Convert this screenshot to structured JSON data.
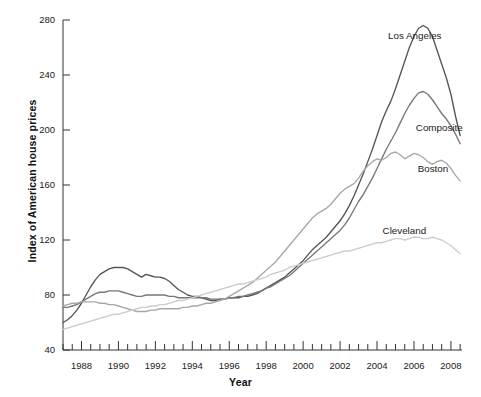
{
  "chart_data": {
    "type": "line",
    "title": "",
    "xlabel": "Year",
    "ylabel": "Index of American house prices",
    "xlim": [
      1987.0,
      2008.6
    ],
    "ylim": [
      40,
      280
    ],
    "yticks": [
      40,
      80,
      120,
      160,
      200,
      240,
      280
    ],
    "xticks": [
      1988,
      1990,
      1992,
      1994,
      1996,
      1998,
      2000,
      2002,
      2004,
      2006,
      2008
    ],
    "xtick_labels": [
      "1988",
      "1990",
      "1992",
      "1994",
      "1996",
      "1998",
      "2000",
      "2002",
      "2004",
      "2006",
      "2008"
    ],
    "ytick_labels": [
      "40",
      "80",
      "120",
      "160",
      "200",
      "240",
      "280"
    ],
    "minor_tick_interval": 0.5,
    "grid": false,
    "legend": "inline-annotations",
    "series": [
      {
        "name": "Los Angeles",
        "color": "#555555",
        "label_x": 2004.6,
        "label_y": 268,
        "x": [
          1987.0,
          1987.25,
          1987.5,
          1987.75,
          1988.0,
          1988.25,
          1988.5,
          1988.75,
          1989.0,
          1989.25,
          1989.5,
          1989.75,
          1990.0,
          1990.25,
          1990.5,
          1990.75,
          1991.0,
          1991.25,
          1991.5,
          1991.75,
          1992.0,
          1992.25,
          1992.5,
          1992.75,
          1993.0,
          1993.25,
          1993.5,
          1993.75,
          1994.0,
          1994.25,
          1994.5,
          1994.75,
          1995.0,
          1995.25,
          1995.5,
          1995.75,
          1996.0,
          1996.25,
          1996.5,
          1996.75,
          1997.0,
          1997.25,
          1997.5,
          1997.75,
          1998.0,
          1998.25,
          1998.5,
          1998.75,
          1999.0,
          1999.25,
          1999.5,
          1999.75,
          2000.0,
          2000.25,
          2000.5,
          2000.75,
          2001.0,
          2001.25,
          2001.5,
          2001.75,
          2002.0,
          2002.25,
          2002.5,
          2002.75,
          2003.0,
          2003.25,
          2003.5,
          2003.75,
          2004.0,
          2004.25,
          2004.5,
          2004.75,
          2005.0,
          2005.25,
          2005.5,
          2005.75,
          2006.0,
          2006.25,
          2006.5,
          2006.75,
          2007.0,
          2007.25,
          2007.5,
          2007.75,
          2008.0,
          2008.25,
          2008.5
        ],
        "y": [
          60,
          62,
          65,
          69,
          74,
          80,
          86,
          91,
          95,
          97,
          99,
          100,
          100,
          100,
          99,
          97,
          95,
          93,
          95,
          94,
          93,
          93,
          92,
          90,
          87,
          84,
          82,
          80,
          79,
          79,
          78,
          77,
          76,
          76,
          77,
          77,
          78,
          78,
          78,
          79,
          79,
          80,
          81,
          83,
          85,
          87,
          89,
          91,
          93,
          96,
          99,
          102,
          105,
          109,
          113,
          116,
          119,
          122,
          126,
          130,
          134,
          139,
          145,
          152,
          160,
          168,
          177,
          186,
          196,
          206,
          214,
          221,
          230,
          240,
          250,
          260,
          268,
          274,
          276,
          274,
          268,
          258,
          248,
          238,
          226,
          210,
          196
        ]
      },
      {
        "name": "Composite",
        "color": "#777777",
        "label_x": 2006.1,
        "label_y": 201,
        "x": [
          1987.0,
          1987.25,
          1987.5,
          1987.75,
          1988.0,
          1988.25,
          1988.5,
          1988.75,
          1989.0,
          1989.25,
          1989.5,
          1989.75,
          1990.0,
          1990.25,
          1990.5,
          1990.75,
          1991.0,
          1991.25,
          1991.5,
          1991.75,
          1992.0,
          1992.25,
          1992.5,
          1992.75,
          1993.0,
          1993.25,
          1993.5,
          1993.75,
          1994.0,
          1994.25,
          1994.5,
          1994.75,
          1995.0,
          1995.25,
          1995.5,
          1995.75,
          1996.0,
          1996.25,
          1996.5,
          1996.75,
          1997.0,
          1997.25,
          1997.5,
          1997.75,
          1998.0,
          1998.25,
          1998.5,
          1998.75,
          1999.0,
          1999.25,
          1999.5,
          1999.75,
          2000.0,
          2000.25,
          2000.5,
          2000.75,
          2001.0,
          2001.25,
          2001.5,
          2001.75,
          2002.0,
          2002.25,
          2002.5,
          2002.75,
          2003.0,
          2003.25,
          2003.5,
          2003.75,
          2004.0,
          2004.25,
          2004.5,
          2004.75,
          2005.0,
          2005.25,
          2005.5,
          2005.75,
          2006.0,
          2006.25,
          2006.5,
          2006.75,
          2007.0,
          2007.25,
          2007.5,
          2007.75,
          2008.0,
          2008.25,
          2008.5
        ],
        "y": [
          71,
          71,
          72,
          73,
          75,
          77,
          79,
          81,
          82,
          82,
          83,
          83,
          83,
          82,
          81,
          80,
          79,
          79,
          80,
          80,
          80,
          80,
          80,
          79,
          79,
          78,
          78,
          78,
          78,
          78,
          78,
          78,
          77,
          77,
          77,
          77,
          78,
          78,
          79,
          79,
          80,
          81,
          82,
          83,
          85,
          86,
          88,
          90,
          92,
          94,
          97,
          100,
          103,
          106,
          109,
          112,
          115,
          118,
          121,
          124,
          127,
          131,
          136,
          142,
          148,
          153,
          159,
          165,
          172,
          179,
          186,
          192,
          198,
          205,
          212,
          218,
          223,
          227,
          228,
          226,
          222,
          217,
          212,
          208,
          203,
          197,
          190
        ]
      },
      {
        "name": "Boston",
        "color": "#a8a8a8",
        "label_x": 2006.2,
        "label_y": 171,
        "x": [
          1987.0,
          1987.25,
          1987.5,
          1987.75,
          1988.0,
          1988.25,
          1988.5,
          1988.75,
          1989.0,
          1989.25,
          1989.5,
          1989.75,
          1990.0,
          1990.25,
          1990.5,
          1990.75,
          1991.0,
          1991.25,
          1991.5,
          1991.75,
          1992.0,
          1992.25,
          1992.5,
          1992.75,
          1993.0,
          1993.25,
          1993.5,
          1993.75,
          1994.0,
          1994.25,
          1994.5,
          1994.75,
          1995.0,
          1995.25,
          1995.5,
          1995.75,
          1996.0,
          1996.25,
          1996.5,
          1996.75,
          1997.0,
          1997.25,
          1997.5,
          1997.75,
          1998.0,
          1998.25,
          1998.5,
          1998.75,
          1999.0,
          1999.25,
          1999.5,
          1999.75,
          2000.0,
          2000.25,
          2000.5,
          2000.75,
          2001.0,
          2001.25,
          2001.5,
          2001.75,
          2002.0,
          2002.25,
          2002.5,
          2002.75,
          2003.0,
          2003.25,
          2003.5,
          2003.75,
          2004.0,
          2004.25,
          2004.5,
          2004.75,
          2005.0,
          2005.25,
          2005.5,
          2005.75,
          2006.0,
          2006.25,
          2006.5,
          2006.75,
          2007.0,
          2007.25,
          2007.5,
          2007.75,
          2008.0,
          2008.25,
          2008.5
        ],
        "y": [
          72,
          73,
          74,
          74,
          75,
          75,
          75,
          75,
          74,
          74,
          73,
          73,
          72,
          71,
          70,
          69,
          68,
          68,
          68,
          69,
          69,
          70,
          70,
          70,
          70,
          70,
          71,
          71,
          72,
          72,
          73,
          74,
          74,
          75,
          76,
          77,
          79,
          81,
          83,
          85,
          87,
          89,
          92,
          95,
          98,
          101,
          104,
          108,
          112,
          116,
          120,
          124,
          128,
          132,
          136,
          139,
          141,
          143,
          146,
          150,
          154,
          157,
          159,
          161,
          165,
          170,
          174,
          177,
          179,
          178,
          180,
          183,
          184,
          182,
          179,
          181,
          183,
          182,
          180,
          177,
          175,
          177,
          178,
          176,
          172,
          167,
          163
        ]
      },
      {
        "name": "Cleveland",
        "color": "#cdcdcd",
        "label_x": 2004.3,
        "label_y": 126,
        "x": [
          1987.0,
          1987.25,
          1987.5,
          1987.75,
          1988.0,
          1988.25,
          1988.5,
          1988.75,
          1989.0,
          1989.25,
          1989.5,
          1989.75,
          1990.0,
          1990.25,
          1990.5,
          1990.75,
          1991.0,
          1991.25,
          1991.5,
          1991.75,
          1992.0,
          1992.25,
          1992.5,
          1992.75,
          1993.0,
          1993.25,
          1993.5,
          1993.75,
          1994.0,
          1994.25,
          1994.5,
          1994.75,
          1995.0,
          1995.25,
          1995.5,
          1995.75,
          1996.0,
          1996.25,
          1996.5,
          1996.75,
          1997.0,
          1997.25,
          1997.5,
          1997.75,
          1998.0,
          1998.25,
          1998.5,
          1998.75,
          1999.0,
          1999.25,
          1999.5,
          1999.75,
          2000.0,
          2000.25,
          2000.5,
          2000.75,
          2001.0,
          2001.25,
          2001.5,
          2001.75,
          2002.0,
          2002.25,
          2002.5,
          2002.75,
          2003.0,
          2003.25,
          2003.5,
          2003.75,
          2004.0,
          2004.25,
          2004.5,
          2004.75,
          2005.0,
          2005.25,
          2005.5,
          2005.75,
          2006.0,
          2006.25,
          2006.5,
          2006.75,
          2007.0,
          2007.25,
          2007.5,
          2007.75,
          2008.0,
          2008.25,
          2008.5
        ],
        "y": [
          55,
          56,
          57,
          58,
          59,
          60,
          61,
          62,
          63,
          64,
          65,
          66,
          66,
          67,
          68,
          69,
          70,
          71,
          71,
          72,
          72,
          73,
          73,
          74,
          75,
          76,
          76,
          77,
          78,
          79,
          80,
          81,
          82,
          83,
          84,
          85,
          86,
          87,
          88,
          88,
          89,
          90,
          91,
          92,
          93,
          95,
          96,
          97,
          98,
          100,
          101,
          102,
          103,
          104,
          105,
          106,
          107,
          108,
          109,
          110,
          111,
          112,
          112,
          113,
          114,
          115,
          116,
          117,
          118,
          118,
          119,
          120,
          121,
          121,
          120,
          121,
          122,
          122,
          121,
          121,
          122,
          121,
          120,
          118,
          116,
          113,
          110
        ]
      }
    ]
  }
}
